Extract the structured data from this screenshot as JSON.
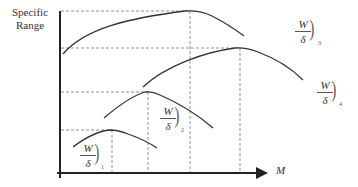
{
  "diagram": {
    "y_axis_label": "Specific Range",
    "x_axis_label": "M",
    "curves": [
      {
        "id": 1,
        "numerator": "W",
        "denominator": "δ",
        "subscript": "1"
      },
      {
        "id": 2,
        "numerator": "W",
        "denominator": "δ",
        "subscript": "2"
      },
      {
        "id": 3,
        "numerator": "W",
        "denominator": "δ",
        "subscript": "3"
      },
      {
        "id": 4,
        "numerator": "W",
        "denominator": "δ",
        "subscript": "4"
      }
    ],
    "colors": {
      "line": "#333333",
      "dash": "#666666"
    }
  }
}
